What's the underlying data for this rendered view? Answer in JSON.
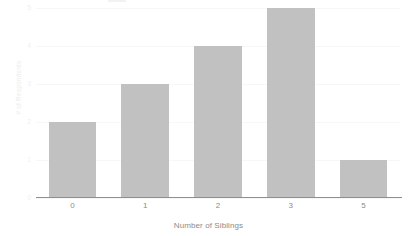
{
  "chart_data": {
    "type": "bar",
    "title": "",
    "xlabel": "Number of Siblings",
    "ylabel": "# of Respondents",
    "categories": [
      "0",
      "1",
      "2",
      "3",
      "5"
    ],
    "values": [
      2,
      3,
      4,
      5,
      1
    ],
    "series": [
      {
        "name": "# of Respondents",
        "values": [
          2,
          3,
          4,
          5,
          1
        ]
      }
    ],
    "ylim": [
      0,
      5
    ],
    "yticks": [
      0,
      1,
      2,
      3,
      4,
      5
    ],
    "ytick_labels": [
      "0",
      "1",
      "2",
      "3",
      "4",
      "5"
    ],
    "grid": true,
    "legend": false,
    "legend_position": "none",
    "bar_color": "#c1c1c1",
    "gridline_color": "#f7f7f7",
    "axis_line_color": "#8f8f8f",
    "tick_label_color": "#8b8b8b",
    "y_label_color": "#ededed",
    "background_color": "#ffffff"
  }
}
